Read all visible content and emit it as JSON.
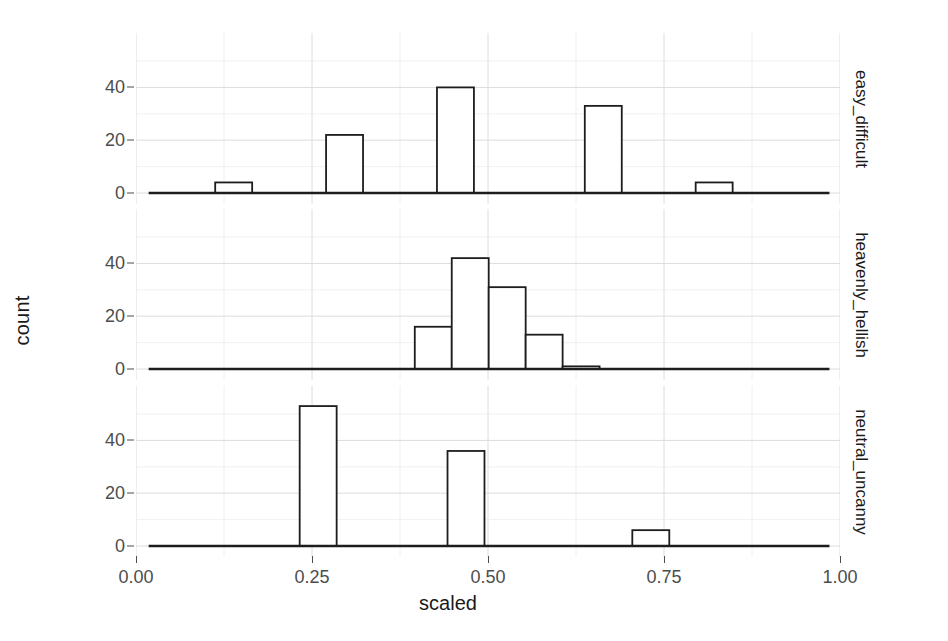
{
  "chart_data": {
    "type": "bar",
    "title": "",
    "subtitle": "",
    "xlabel": "scaled",
    "ylabel": "count",
    "xlim": [
      0.0,
      1.0
    ],
    "ylim": [
      0,
      53
    ],
    "grid": true,
    "legend": "none",
    "facet_direction": "vertical",
    "facet_strip_position": "right",
    "x_ticks": [
      0.0,
      0.25,
      0.5,
      0.75,
      1.0
    ],
    "x_tick_labels": [
      "0.00",
      "0.25",
      "0.50",
      "0.75",
      "1.00"
    ],
    "y_ticks": [
      0,
      20,
      40
    ],
    "y_tick_labels": [
      "0",
      "20",
      "40"
    ],
    "bin_width": 0.0525,
    "panels": [
      {
        "strip_label": "easy_difficult",
        "y_ticks": [
          0,
          20,
          40
        ],
        "y_tick_labels": [
          "0",
          "20",
          "40"
        ],
        "bins": [
          {
            "x_start": 0.1125,
            "x_end": 0.165,
            "count": 4
          },
          {
            "x_start": 0.27,
            "x_end": 0.3225,
            "count": 22
          },
          {
            "x_start": 0.4275,
            "x_end": 0.48,
            "count": 40
          },
          {
            "x_start": 0.6375,
            "x_end": 0.69,
            "count": 33
          },
          {
            "x_start": 0.795,
            "x_end": 0.8475,
            "count": 4
          }
        ]
      },
      {
        "strip_label": "heavenly_hellish",
        "y_ticks": [
          0,
          20,
          40
        ],
        "y_tick_labels": [
          "0",
          "20",
          "40"
        ],
        "bins": [
          {
            "x_start": 0.396,
            "x_end": 0.4485,
            "count": 16
          },
          {
            "x_start": 0.4485,
            "x_end": 0.501,
            "count": 42
          },
          {
            "x_start": 0.501,
            "x_end": 0.5535,
            "count": 31
          },
          {
            "x_start": 0.5535,
            "x_end": 0.606,
            "count": 13
          },
          {
            "x_start": 0.606,
            "x_end": 0.6585,
            "count": 1
          }
        ]
      },
      {
        "strip_label": "neutral_uncanny",
        "y_ticks": [
          0,
          20,
          40
        ],
        "y_tick_labels": [
          "0",
          "20",
          "40"
        ],
        "bins": [
          {
            "x_start": 0.2325,
            "x_end": 0.285,
            "count": 53
          },
          {
            "x_start": 0.4425,
            "x_end": 0.495,
            "count": 36
          },
          {
            "x_start": 0.705,
            "x_end": 0.7575,
            "count": 6
          }
        ]
      }
    ]
  },
  "axes": {
    "x_title": "scaled",
    "y_title": "count"
  },
  "colors": {
    "background": "#ffffff",
    "bar_outline": "#1d1d1d",
    "bar_fill": "#ffffff",
    "grid_major": "#dcdcdc",
    "grid_minor": "#ececed",
    "text": "#1a1a1a",
    "tick_text": "#4d4d4d"
  }
}
